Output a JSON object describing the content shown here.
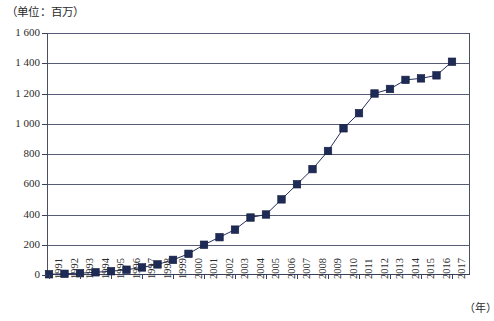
{
  "caption": {
    "unit_note": "（单位：百万）"
  },
  "axes": {
    "x_unit_label": "（年）",
    "y_tick_labels": [
      "1 600",
      "1 400",
      "1 200",
      "1 000",
      "800",
      "600",
      "400",
      "200",
      "0"
    ],
    "x_tick_labels": [
      "1991",
      "1992",
      "1993",
      "1994",
      "1995",
      "1996",
      "1997",
      "1998",
      "1999",
      "2000",
      "2001",
      "2002",
      "2003",
      "2004",
      "2005",
      "2006",
      "2007",
      "2008",
      "2009",
      "2010",
      "2011",
      "2012",
      "2013",
      "2014",
      "2015",
      "2016",
      "2017"
    ]
  },
  "style": {
    "marker_color": "#1f2b57",
    "line_color": "#25305e",
    "grid_color": "#39405c",
    "axis_color": "#4a4f63",
    "background": "#ffffff"
  },
  "chart_data": {
    "type": "line",
    "title": "（单位：百万）",
    "xlabel": "（年）",
    "ylabel": "",
    "ylim": [
      0,
      1600
    ],
    "ytick_step": 200,
    "grid": true,
    "legend": "none",
    "marker": "square",
    "categories": [
      "1991",
      "1992",
      "1993",
      "1994",
      "1995",
      "1996",
      "1997",
      "1998",
      "1999",
      "2000",
      "2001",
      "2002",
      "2003",
      "2004",
      "2005",
      "2006",
      "2007",
      "2008",
      "2009",
      "2010",
      "2011",
      "2012",
      "2013",
      "2014",
      "2015",
      "2016",
      "2017"
    ],
    "x": [
      1991,
      1992,
      1993,
      1994,
      1995,
      1996,
      1997,
      1998,
      1999,
      2000,
      2001,
      2002,
      2003,
      2004,
      2005,
      2006,
      2007,
      2008,
      2009,
      2010,
      2011,
      2012,
      2013,
      2014,
      2015,
      2016,
      2017
    ],
    "values": [
      5,
      8,
      12,
      18,
      25,
      35,
      50,
      70,
      100,
      140,
      200,
      250,
      300,
      380,
      400,
      500,
      600,
      700,
      820,
      970,
      1070,
      1200,
      1230,
      1290,
      1300,
      1320,
      1410
    ],
    "series": [
      {
        "name": "数值",
        "values": [
          5,
          8,
          12,
          18,
          25,
          35,
          50,
          70,
          100,
          140,
          200,
          250,
          300,
          380,
          400,
          500,
          600,
          700,
          820,
          970,
          1070,
          1200,
          1230,
          1290,
          1300,
          1320,
          1410
        ]
      }
    ]
  }
}
